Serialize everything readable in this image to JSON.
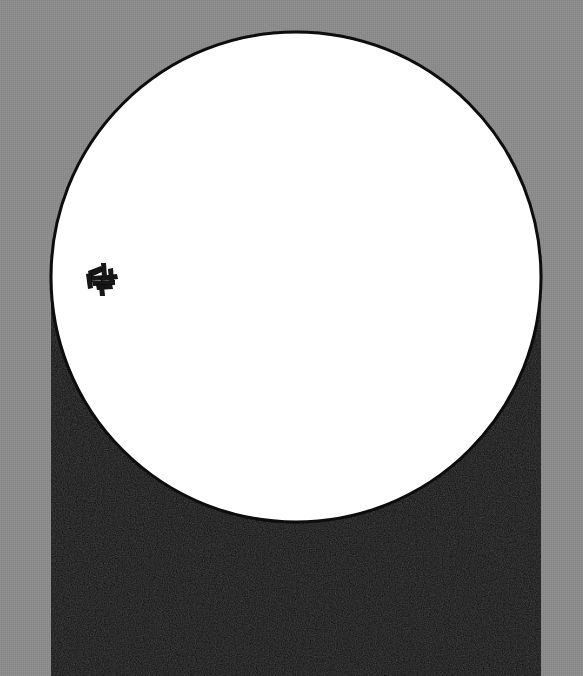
{
  "canvas": {
    "width": 583,
    "height": 676,
    "background_color": "#8c8c8c",
    "background_name": "gray-textured-backdrop"
  },
  "shapes": {
    "arch": {
      "name": "black-arch-panel",
      "fill_color": "#080808",
      "left": 48,
      "right": 533,
      "bottom": 676,
      "arc_top_y": 32,
      "arc_center_x": 296,
      "arc_center_y": 277,
      "arc_radius": 245,
      "shoulder_y": 300
    },
    "circle": {
      "name": "white-circle",
      "fill_color": "#ffffff",
      "stroke_color": "#0a0a0a",
      "stroke_width": 3,
      "center_x": 296,
      "center_y": 277,
      "radius": 245
    },
    "mark": {
      "name": "ink-glyph-mark",
      "fill_color": "#121212",
      "x": 86,
      "y": 263,
      "width": 33,
      "height": 34,
      "description": "small hand-inked angular glyph"
    }
  },
  "labels": {
    "title": "",
    "subtitle": "",
    "caption": ""
  }
}
